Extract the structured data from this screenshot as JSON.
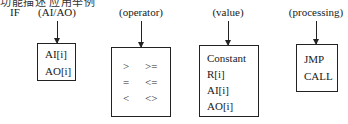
{
  "header": {
    "cut_text": "功能描述 应用举例"
  },
  "diagram": {
    "keyword": "IF",
    "columns": [
      {
        "label": "(AI/AO)",
        "items": [
          "AI[i]",
          "AO[i]"
        ]
      },
      {
        "label": "(operator)",
        "items": [
          ">",
          ">=",
          "=",
          "<=",
          "<",
          "<>"
        ]
      },
      {
        "label": "(value)",
        "items": [
          "Constant",
          "R[i]",
          "AI[i]",
          "AO[i]"
        ]
      },
      {
        "label": "(processing)",
        "items": [
          "JMP",
          "CALL"
        ]
      }
    ]
  }
}
